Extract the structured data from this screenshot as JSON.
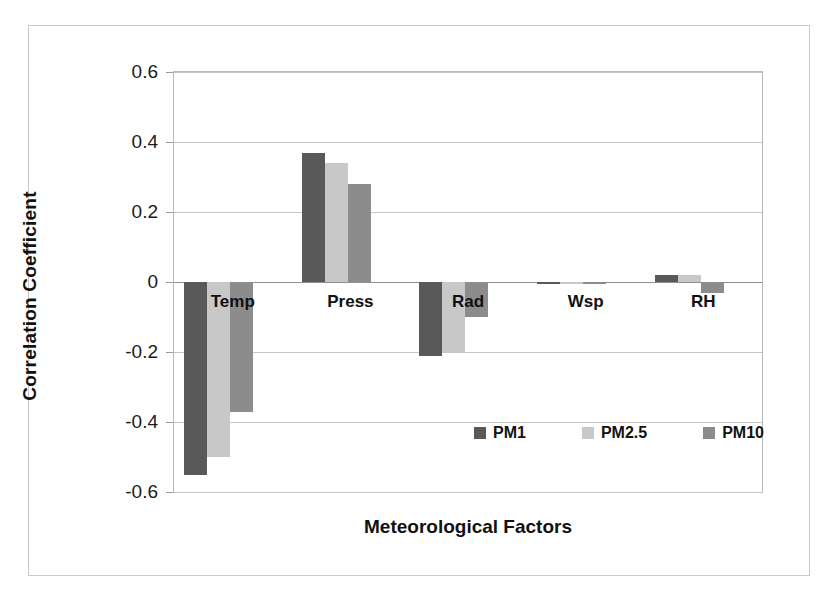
{
  "chart_data": {
    "type": "bar",
    "title": "",
    "xlabel": "Meteorological Factors",
    "ylabel": "Correlation Coefficient",
    "categories": [
      "Temp",
      "Press",
      "Rad",
      "Wsp",
      "RH"
    ],
    "series": [
      {
        "name": "PM1",
        "color": "#595959",
        "values": [
          -0.55,
          0.37,
          -0.21,
          -0.005,
          0.02
        ]
      },
      {
        "name": "PM2.5",
        "color": "#c8c8c8",
        "values": [
          -0.5,
          0.34,
          -0.2,
          -0.005,
          0.02
        ]
      },
      {
        "name": "PM10",
        "color": "#8c8c8c",
        "values": [
          -0.37,
          0.28,
          -0.1,
          -0.005,
          -0.03
        ]
      }
    ],
    "ylim": [
      -0.6,
      0.6
    ],
    "yticks": [
      "0.6",
      "0.4",
      "0.2",
      "0",
      "-0.2",
      "-0.4",
      "-0.6"
    ],
    "ytick_values": [
      0.6,
      0.4,
      0.2,
      0,
      -0.2,
      -0.4,
      -0.6
    ],
    "grid": true,
    "legend_position": "inside-bottom-right"
  },
  "legend": {
    "items": [
      {
        "label": "PM1",
        "color": "#595959"
      },
      {
        "label": "PM2.5",
        "color": "#c8c8c8"
      },
      {
        "label": "PM10",
        "color": "#8c8c8c"
      }
    ]
  }
}
